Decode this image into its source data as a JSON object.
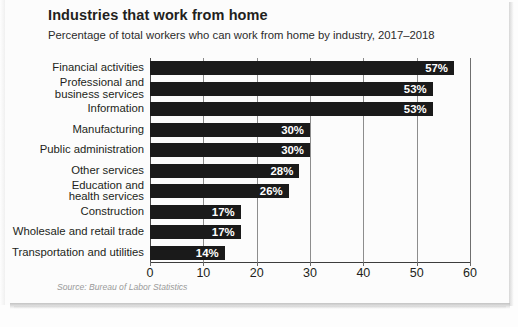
{
  "header": {
    "title": "Industries that work from home",
    "subtitle": "Percentage of total workers who can work from home by industry, 2017–2018"
  },
  "source": "Source: Bureau of Labor Statistics",
  "colors": {
    "bar": "#1a1a1a",
    "value_text": "#ffffff",
    "gridline": "#8d8d8d",
    "axis": "#3d3d3d",
    "title_text": "#231f20",
    "source_text": "#9a9a9a",
    "background": "#fcfcfc"
  },
  "chart_data": {
    "type": "bar",
    "orientation": "horizontal",
    "title": "Industries that work from home",
    "subtitle": "Percentage of total workers who can work from home by industry, 2017–2018",
    "xlabel": "",
    "ylabel": "",
    "xlim": [
      0,
      60
    ],
    "xticks": [
      0,
      10,
      20,
      30,
      40,
      50,
      60
    ],
    "xtick_labels": [
      "0",
      "10",
      "20",
      "30",
      "40",
      "50",
      "60"
    ],
    "grid": true,
    "legend": null,
    "value_suffix": "%",
    "categories": [
      "Financial activities",
      "Professional and business services",
      "Information",
      "Manufacturing",
      "Public administration",
      "Other services",
      "Education and health services",
      "Construction",
      "Wholesale and retail trade",
      "Transportation and utilities"
    ],
    "category_lines": [
      [
        "Financial activities"
      ],
      [
        "Professional and",
        "business services"
      ],
      [
        "Information"
      ],
      [
        "Manufacturing"
      ],
      [
        "Public administration"
      ],
      [
        "Other services"
      ],
      [
        "Education and",
        "health services"
      ],
      [
        "Construction"
      ],
      [
        "Wholesale and retail trade"
      ],
      [
        "Transportation and utilities"
      ]
    ],
    "values": [
      57,
      53,
      53,
      30,
      30,
      28,
      26,
      17,
      17,
      14
    ],
    "value_labels": [
      "57%",
      "53%",
      "53%",
      "30%",
      "30%",
      "28%",
      "26%",
      "17%",
      "17%",
      "14%"
    ]
  }
}
